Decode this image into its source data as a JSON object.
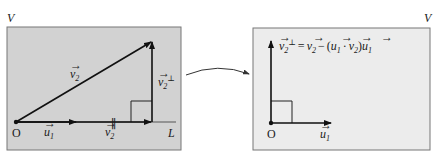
{
  "figure": {
    "left_panel": {
      "space_label": "V",
      "line_label": "L",
      "origin_label": "O",
      "vectors": {
        "v2": {
          "base": "v",
          "sub": "2",
          "arrow": "⃗"
        },
        "u1": {
          "base": "u",
          "sub": "1"
        },
        "v2_parallel": {
          "base": "v",
          "sub": "2",
          "sup": "∥"
        },
        "v2_perp": {
          "base": "v",
          "sub": "2",
          "sup": "⊥"
        }
      },
      "background": "#d2d2d2"
    },
    "right_panel": {
      "space_label": "V",
      "origin_label": "O",
      "formula": "v⃗₂⊥ = v⃗₂ − (u⃗₁ · v⃗₂)u⃗₁",
      "formula_parts": {
        "lhs": "v",
        "lhs_sub": "2",
        "lhs_sup": "⊥",
        "eq": "=",
        "v": "v",
        "v_sub": "2",
        "minus": "−",
        "open": "(",
        "u": "u",
        "u_sub": "1",
        "dot": "·",
        "v2": "v",
        "v2_sub": "2",
        "close": ")",
        "u2": "u",
        "u2_sub": "1"
      },
      "axis_label": {
        "base": "u",
        "sub": "1"
      },
      "background": "#ececec"
    },
    "transition_arrow": "curved-arrow"
  }
}
